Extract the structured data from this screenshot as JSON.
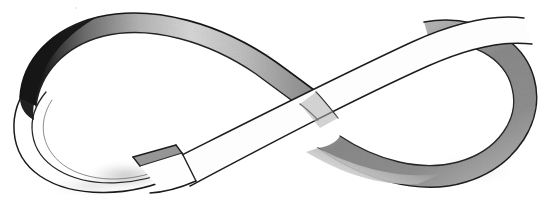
{
  "artwork": {
    "title": "Infinity Ribbon (Mobius Strip) Pencil Sketch",
    "medium": "graphite pencil on white paper",
    "subject": "mobius-strip-infinity-loop",
    "alt_text": "A hand-drawn pencil sketch of a wide flat ribbon twisted into a figure-eight infinity shape, with one open cut end near the lower center.",
    "background_color": "#ffffff",
    "ink_color": "#1a1a1a",
    "canvas": {
      "width": 545,
      "height": 203
    }
  },
  "palette": {
    "paper_white": "#ffffff",
    "ribbon_face": "#fdfdfd",
    "outline_dark": "#1c1c1c",
    "outline_mid": "#3a3a3a",
    "shade_deep_black": "#141414",
    "shade_dark_gray": "#4a4a4a",
    "shade_mid_gray": "#8f8f8f",
    "shade_light_gray": "#c4c4c4",
    "shade_pale_gray": "#e2e2e2",
    "edge_thickness_gray": "#9a9a9a"
  },
  "shapes": {
    "upper_left_band": {
      "name": "upper-left-ribbon-band",
      "description": "Broad ribbon arc sweeping from far left up over the top and down to the center crossing, shaded dark at the left twist fading to pale at the right.",
      "outer_path": "M 22 96 C 24 62, 52 30, 96 19 C 150 6, 216 22, 268 57 C 288 70, 300 78, 310 85",
      "inner_path": "M 38 104 C 42 74, 66 46, 104 36 C 152 24, 212 40, 258 72 C 276 84, 288 91, 296 97",
      "shade_gradient": [
        "#141414",
        "#6a6a6a",
        "#b8b8b8",
        "#e8e8e8"
      ]
    },
    "left_loop": {
      "name": "left-loop-edge",
      "description": "Thin edge-on view of the ribbon curling around the left end of the figure eight, drawn as two near-parallel fine lines.",
      "outer_path": "M 30 84 C 8 110, 12 152, 44 176 C 78 200, 132 196, 170 176",
      "inner_path": "M 44 92 C 26 116, 30 150, 58 170 C 88 190, 134 186, 168 168"
    },
    "lower_center_band": {
      "name": "lower-center-ribbon-band",
      "description": "The wide front-facing ribbon crossing diagonally from the lower-left cut end up to the upper right loop.",
      "top_path": "M 170 160 C 240 126, 330 80, 420 42 C 460 26, 492 18, 516 20",
      "bottom_path": "M 196 184 C 266 150, 356 104, 444 66 C 482 50, 510 44, 528 46"
    },
    "cut_end": {
      "name": "ribbon-cut-end",
      "description": "Open rectangular cut end of the ribbon showing a gray edge-thickness sliver; tip near (134,156), notch corner near (176,148), lower corner near (196,180).",
      "path": "M 134 157 L 176 147 L 182 154 L 143 165 Z",
      "edge_fill": "#9a9a9a"
    },
    "right_loop": {
      "name": "right-loop-band",
      "description": "Large rounded right-hand loop of the figure eight with broad mid-gray shading along the outer curve.",
      "outer_path": "M 430 24 C 492 14, 538 46, 537 96 C 536 148, 486 186, 430 184 C 380 182, 336 160, 310 140",
      "inner_path": "M 432 44 C 482 36, 516 62, 515 98 C 514 138, 474 166, 430 164 C 392 162, 356 146, 330 130",
      "shade_gradient": [
        "#d8d8d8",
        "#9c9c9c",
        "#868686",
        "#b0b0b0"
      ]
    },
    "bottom_left_shadow": {
      "name": "bottom-left-soft-shadow",
      "description": "Soft pale graphite smudge under the lower-left loop crossing.",
      "center": [
        120,
        178
      ],
      "color": "#cfcfcf"
    }
  },
  "shading_notes": [
    {
      "region": "top-left-twist",
      "value": "near black",
      "hex": "#141414"
    },
    {
      "region": "upper-band-midsection",
      "value": "light gray gradient",
      "hex": "#c9c9c9"
    },
    {
      "region": "upper-band-right-taper",
      "value": "mid gray",
      "hex": "#9e9e9e"
    },
    {
      "region": "right-loop-outer-curve",
      "value": "mid gray wash",
      "hex": "#8f8f8f"
    },
    {
      "region": "lower-right-band-underside",
      "value": "mid gray",
      "hex": "#a6a6a6"
    },
    {
      "region": "bottom-left-crossing",
      "value": "pale gray smudge",
      "hex": "#d2d2d2"
    },
    {
      "region": "cut-end-edge",
      "value": "mid gray sliver",
      "hex": "#9a9a9a"
    },
    {
      "region": "ribbon-front-faces",
      "value": "paper white",
      "hex": "#fdfdfd"
    }
  ]
}
